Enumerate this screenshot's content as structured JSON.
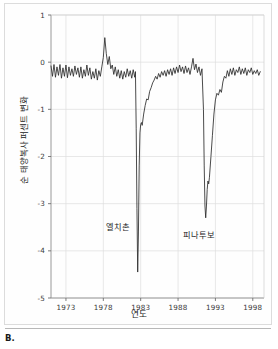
{
  "panel": {
    "caption": "B."
  },
  "chart_data": {
    "type": "line",
    "title": "",
    "xlabel": "연도",
    "ylabel": "순 태양복사 퍼센트 변화",
    "xlim": [
      1971.0,
      1999.5
    ],
    "ylim": [
      -5,
      1
    ],
    "grid": true,
    "legend": "none",
    "xticks": [
      1973,
      1978,
      1983,
      1988,
      1993,
      1998
    ],
    "xtick_labels": [
      "1973",
      "1978",
      "1983",
      "1988",
      "1993",
      "1998"
    ],
    "yticks": [
      1,
      0,
      -1,
      -2,
      -3,
      -4,
      -5
    ],
    "ytick_labels": [
      "1",
      "0",
      "-1",
      "-2",
      "-3",
      "-4",
      "-5"
    ],
    "line_color": "#2b2b2b",
    "grid_color": "#dedede",
    "annotations": [
      {
        "text": "엘치촌",
        "x": 1981.0,
        "y": -3.45
      },
      {
        "text": "피나투보",
        "x": 1991.3,
        "y": -3.62
      }
    ],
    "series": [
      {
        "name": "순 태양복사 퍼센트 변화",
        "x": [
          1971.0,
          1971.2,
          1971.4,
          1971.6,
          1971.8,
          1972.0,
          1972.2,
          1972.4,
          1972.6,
          1972.8,
          1973.0,
          1973.2,
          1973.4,
          1973.6,
          1973.8,
          1974.0,
          1974.2,
          1974.4,
          1974.6,
          1974.8,
          1975.0,
          1975.2,
          1975.4,
          1975.6,
          1975.8,
          1976.0,
          1976.2,
          1976.4,
          1976.6,
          1976.8,
          1977.0,
          1977.2,
          1977.4,
          1977.6,
          1977.8,
          1978.0,
          1978.2,
          1978.4,
          1978.6,
          1978.8,
          1979.0,
          1979.2,
          1979.4,
          1979.6,
          1979.8,
          1980.0,
          1980.2,
          1980.4,
          1980.6,
          1980.8,
          1981.0,
          1981.2,
          1981.4,
          1981.6,
          1981.8,
          1982.0,
          1982.2,
          1982.3,
          1982.4,
          1982.5,
          1982.6,
          1982.7,
          1982.8,
          1982.9,
          1983.0,
          1983.1,
          1983.2,
          1983.4,
          1983.6,
          1983.8,
          1984.0,
          1984.2,
          1984.4,
          1984.6,
          1984.8,
          1985.0,
          1985.2,
          1985.4,
          1985.6,
          1985.8,
          1986.0,
          1986.2,
          1986.4,
          1986.6,
          1986.8,
          1987.0,
          1987.2,
          1987.4,
          1987.6,
          1987.8,
          1988.0,
          1988.2,
          1988.4,
          1988.6,
          1988.8,
          1989.0,
          1989.2,
          1989.4,
          1989.6,
          1989.8,
          1990.0,
          1990.2,
          1990.4,
          1990.6,
          1990.8,
          1991.0,
          1991.2,
          1991.4,
          1991.5,
          1991.6,
          1991.7,
          1991.8,
          1991.9,
          1992.0,
          1992.1,
          1992.2,
          1992.4,
          1992.6,
          1992.8,
          1993.0,
          1993.2,
          1993.4,
          1993.6,
          1993.8,
          1994.0,
          1994.2,
          1994.4,
          1994.6,
          1994.8,
          1995.0,
          1995.2,
          1995.4,
          1995.6,
          1995.8,
          1996.0,
          1996.2,
          1996.4,
          1996.6,
          1996.8,
          1997.0,
          1997.2,
          1997.4,
          1997.6,
          1997.8,
          1998.0,
          1998.2,
          1998.4,
          1998.6,
          1998.8,
          1999.0
        ],
        "y": [
          -0.08,
          -0.3,
          -0.05,
          -0.32,
          -0.1,
          -0.28,
          -0.05,
          -0.34,
          -0.12,
          -0.3,
          -0.06,
          -0.33,
          -0.1,
          -0.28,
          -0.14,
          -0.3,
          -0.08,
          -0.26,
          -0.12,
          -0.32,
          -0.1,
          -0.34,
          -0.16,
          -0.3,
          -0.06,
          -0.28,
          -0.12,
          -0.36,
          -0.2,
          -0.34,
          -0.14,
          -0.38,
          -0.18,
          -0.3,
          -0.1,
          0.1,
          0.52,
          0.18,
          -0.05,
          0.12,
          -0.14,
          -0.06,
          -0.26,
          -0.1,
          -0.3,
          -0.16,
          -0.34,
          -0.18,
          -0.36,
          -0.2,
          -0.32,
          -0.14,
          -0.3,
          -0.18,
          -0.34,
          -0.16,
          -0.32,
          -0.2,
          -1.4,
          -3.1,
          -4.45,
          -3.6,
          -2.2,
          -1.5,
          -1.32,
          -1.28,
          -1.34,
          -1.1,
          -0.92,
          -0.78,
          -0.8,
          -0.62,
          -0.54,
          -0.44,
          -0.38,
          -0.3,
          -0.36,
          -0.24,
          -0.32,
          -0.2,
          -0.28,
          -0.18,
          -0.3,
          -0.16,
          -0.26,
          -0.14,
          -0.28,
          -0.12,
          -0.24,
          -0.1,
          -0.22,
          -0.06,
          -0.2,
          -0.1,
          -0.24,
          -0.08,
          -0.22,
          -0.12,
          -0.26,
          -0.1,
          0.08,
          -0.16,
          -0.04,
          -0.22,
          -0.1,
          -0.28,
          -0.14,
          -1.0,
          -2.2,
          -3.05,
          -3.3,
          -3.05,
          -2.7,
          -2.52,
          -2.58,
          -2.44,
          -2.0,
          -1.55,
          -1.1,
          -0.8,
          -0.66,
          -0.7,
          -0.58,
          -0.64,
          -0.42,
          -0.3,
          -0.34,
          -0.18,
          -0.3,
          -0.14,
          -0.26,
          -0.12,
          -0.28,
          -0.16,
          -0.22,
          -0.1,
          -0.26,
          -0.14,
          -0.24,
          -0.12,
          -0.28,
          -0.16,
          -0.22,
          -0.12,
          -0.26,
          -0.18,
          -0.24,
          -0.16,
          -0.28,
          -0.2
        ]
      }
    ]
  }
}
